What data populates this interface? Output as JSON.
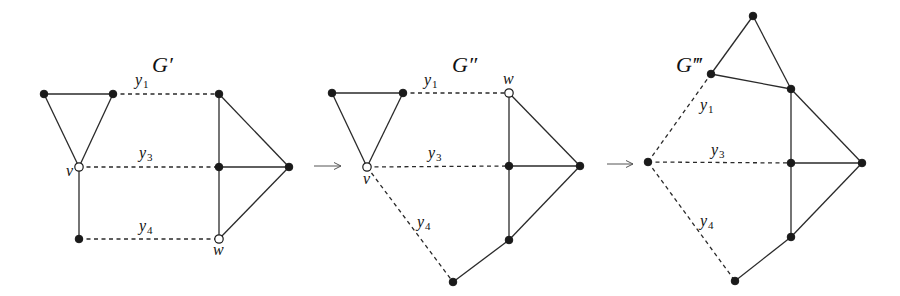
{
  "colors": {
    "ink": "#1a1a1a",
    "background": "#ffffff",
    "arrow": "#555555"
  },
  "graphs": [
    {
      "id": "g1",
      "title": "G′",
      "title_pos": [
        152,
        72
      ],
      "nodes": [
        {
          "id": "a",
          "x": 44,
          "y": 94,
          "type": "filled"
        },
        {
          "id": "b",
          "x": 113,
          "y": 94,
          "type": "filled"
        },
        {
          "id": "v",
          "x": 79,
          "y": 167,
          "type": "open",
          "label": "v",
          "lx": 66,
          "ly": 176
        },
        {
          "id": "c",
          "x": 79,
          "y": 239,
          "type": "filled"
        },
        {
          "id": "d",
          "x": 219,
          "y": 94,
          "type": "filled"
        },
        {
          "id": "e",
          "x": 219,
          "y": 167,
          "type": "filled"
        },
        {
          "id": "f",
          "x": 289,
          "y": 167,
          "type": "filled"
        },
        {
          "id": "w",
          "x": 219,
          "y": 239,
          "type": "open",
          "label": "w",
          "lx": 213,
          "ly": 255
        }
      ],
      "edges": [
        {
          "from": "a",
          "to": "b"
        },
        {
          "from": "a",
          "to": "v"
        },
        {
          "from": "b",
          "to": "v"
        },
        {
          "from": "v",
          "to": "c"
        },
        {
          "from": "d",
          "to": "e"
        },
        {
          "from": "e",
          "to": "w"
        },
        {
          "from": "d",
          "to": "f"
        },
        {
          "from": "e",
          "to": "f"
        },
        {
          "from": "w",
          "to": "f"
        },
        {
          "from": "b",
          "to": "d",
          "dashed": true,
          "label": "y",
          "sub": "1",
          "lx": 135,
          "ly": 85
        },
        {
          "from": "v",
          "to": "e",
          "dashed": true,
          "label": "y",
          "sub": "3",
          "lx": 139,
          "ly": 158
        },
        {
          "from": "c",
          "to": "w",
          "dashed": true,
          "label": "y",
          "sub": "4",
          "lx": 139,
          "ly": 231
        }
      ]
    },
    {
      "id": "g2",
      "title": "G″",
      "title_pos": [
        452,
        72
      ],
      "nodes": [
        {
          "id": "a",
          "x": 332,
          "y": 93,
          "type": "filled"
        },
        {
          "id": "b",
          "x": 403,
          "y": 93,
          "type": "filled"
        },
        {
          "id": "v",
          "x": 367,
          "y": 167,
          "type": "open",
          "label": "v",
          "lx": 363,
          "ly": 184
        },
        {
          "id": "w",
          "x": 509,
          "y": 93,
          "type": "open",
          "label": "w",
          "lx": 503,
          "ly": 84
        },
        {
          "id": "e",
          "x": 509,
          "y": 166,
          "type": "filled"
        },
        {
          "id": "f",
          "x": 580,
          "y": 166,
          "type": "filled"
        },
        {
          "id": "g",
          "x": 509,
          "y": 240,
          "type": "filled"
        },
        {
          "id": "h",
          "x": 453,
          "y": 282,
          "type": "filled"
        }
      ],
      "edges": [
        {
          "from": "a",
          "to": "b"
        },
        {
          "from": "a",
          "to": "v"
        },
        {
          "from": "b",
          "to": "v"
        },
        {
          "from": "w",
          "to": "e"
        },
        {
          "from": "e",
          "to": "g"
        },
        {
          "from": "w",
          "to": "f"
        },
        {
          "from": "e",
          "to": "f"
        },
        {
          "from": "g",
          "to": "f"
        },
        {
          "from": "g",
          "to": "h"
        },
        {
          "from": "b",
          "to": "w",
          "dashed": true,
          "label": "y",
          "sub": "1",
          "lx": 424,
          "ly": 85
        },
        {
          "from": "v",
          "to": "e",
          "dashed": true,
          "label": "y",
          "sub": "3",
          "lx": 428,
          "ly": 158
        },
        {
          "from": "v",
          "to": "h",
          "dashed": true,
          "label": "y",
          "sub": "4",
          "lx": 417,
          "ly": 227
        }
      ]
    },
    {
      "id": "g3",
      "title": "G‴",
      "title_pos": [
        676,
        72
      ],
      "nodes": [
        {
          "id": "t",
          "x": 753,
          "y": 16,
          "type": "filled"
        },
        {
          "id": "a",
          "x": 711,
          "y": 74,
          "type": "filled"
        },
        {
          "id": "d",
          "x": 791,
          "y": 89,
          "type": "filled"
        },
        {
          "id": "l",
          "x": 648,
          "y": 162,
          "type": "filled"
        },
        {
          "id": "e",
          "x": 791,
          "y": 163,
          "type": "filled"
        },
        {
          "id": "f",
          "x": 862,
          "y": 163,
          "type": "filled"
        },
        {
          "id": "g",
          "x": 791,
          "y": 237,
          "type": "filled"
        },
        {
          "id": "h",
          "x": 735,
          "y": 281,
          "type": "filled"
        }
      ],
      "edges": [
        {
          "from": "t",
          "to": "a"
        },
        {
          "from": "t",
          "to": "d"
        },
        {
          "from": "a",
          "to": "d"
        },
        {
          "from": "d",
          "to": "e"
        },
        {
          "from": "e",
          "to": "g"
        },
        {
          "from": "d",
          "to": "f"
        },
        {
          "from": "e",
          "to": "f"
        },
        {
          "from": "g",
          "to": "f"
        },
        {
          "from": "g",
          "to": "h"
        },
        {
          "from": "l",
          "to": "a",
          "dashed": true,
          "label": "y",
          "sub": "1",
          "lx": 700,
          "ly": 110
        },
        {
          "from": "l",
          "to": "e",
          "dashed": true,
          "label": "y",
          "sub": "3",
          "lx": 711,
          "ly": 155
        },
        {
          "from": "l",
          "to": "h",
          "dashed": true,
          "label": "y",
          "sub": "4",
          "lx": 700,
          "ly": 226
        }
      ]
    }
  ],
  "arrows": [
    {
      "x1": 314,
      "y1": 166,
      "x2": 341,
      "y2": 166
    },
    {
      "x1": 607,
      "y1": 164,
      "x2": 633,
      "y2": 164
    }
  ]
}
